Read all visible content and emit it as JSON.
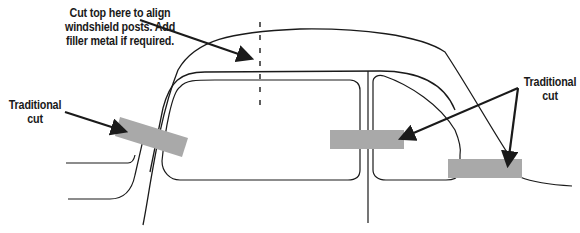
{
  "diagram": {
    "colors": {
      "line": "#1a1a1a",
      "cut_band": "#a9a9a9",
      "background": "#ffffff"
    },
    "annotations": [
      {
        "id": "windshield-cut-note",
        "lines": [
          "Cut top here to align",
          "windshield posts. Add",
          "filler metal if required."
        ],
        "points_to": "dashed vertical cut line at windshield post"
      },
      {
        "id": "left-traditional-cut",
        "lines": [
          "Traditional",
          "cut"
        ],
        "points_to": "gray band across A-pillar"
      },
      {
        "id": "right-traditional-cut",
        "lines": [
          "Traditional",
          "cut"
        ],
        "points_to": [
          "gray band across B-pillar",
          "gray band across C-pillar"
        ]
      }
    ]
  }
}
